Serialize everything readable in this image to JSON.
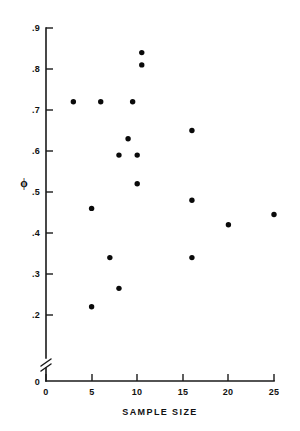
{
  "chart_data": {
    "type": "scatter",
    "title": "",
    "xlabel": "SAMPLE SIZE",
    "ylabel": "ϕ",
    "xlim": [
      0,
      25
    ],
    "ylim": [
      0.15,
      0.9
    ],
    "grid": false,
    "legend": "none",
    "y_axis_break": true,
    "y_axis_break_note": "axis broken between 0 and .2",
    "x_ticks": [
      "0",
      "5",
      "10",
      "15",
      "20",
      "25"
    ],
    "x_tick_values": [
      0,
      5,
      10,
      15,
      20,
      25
    ],
    "y_ticks": [
      "0",
      ".2",
      ".3",
      ".4",
      ".5",
      ".6",
      ".7",
      ".8",
      ".9"
    ],
    "y_tick_values": [
      0,
      0.2,
      0.3,
      0.4,
      0.5,
      0.6,
      0.7,
      0.8,
      0.9
    ],
    "series": [
      {
        "name": "observations",
        "marker": "filled-circle",
        "color": "#0a0a0a",
        "x": [
          10.5,
          10.5,
          3.0,
          6.0,
          9.5,
          9.0,
          8.0,
          10.0,
          10.0,
          16.0,
          25.0,
          20.0,
          5.0,
          7.0,
          16.0,
          8.0,
          5.0
        ],
        "y": [
          0.84,
          0.81,
          0.72,
          0.72,
          0.72,
          0.63,
          0.59,
          0.59,
          0.52,
          0.65,
          0.445,
          0.42,
          0.46,
          0.34,
          0.34,
          0.265,
          0.22
        ]
      }
    ],
    "points": [
      {
        "x": 10.5,
        "y": 0.84
      },
      {
        "x": 10.5,
        "y": 0.81
      },
      {
        "x": 3.0,
        "y": 0.72
      },
      {
        "x": 6.0,
        "y": 0.72
      },
      {
        "x": 9.5,
        "y": 0.72
      },
      {
        "x": 16.0,
        "y": 0.65
      },
      {
        "x": 9.0,
        "y": 0.63
      },
      {
        "x": 8.0,
        "y": 0.59
      },
      {
        "x": 10.0,
        "y": 0.59
      },
      {
        "x": 10.0,
        "y": 0.52
      },
      {
        "x": 16.0,
        "y": 0.48
      },
      {
        "x": 5.0,
        "y": 0.46
      },
      {
        "x": 25.0,
        "y": 0.445
      },
      {
        "x": 20.0,
        "y": 0.42
      },
      {
        "x": 7.0,
        "y": 0.34
      },
      {
        "x": 16.0,
        "y": 0.34
      },
      {
        "x": 8.0,
        "y": 0.265
      },
      {
        "x": 5.0,
        "y": 0.22
      }
    ],
    "point_count": 18
  },
  "axes": {
    "x_title": "SAMPLE SIZE",
    "y_title": "ϕ",
    "x_tick_labels": [
      "0",
      "5",
      "10",
      "15",
      "20",
      "25"
    ],
    "y_tick_labels": [
      ".9",
      ".8",
      ".7",
      ".6",
      ".5",
      ".4",
      ".3",
      ".2",
      "0"
    ],
    "origin_label": "0"
  },
  "colors": {
    "ink": "#111111",
    "marker": "#0a0a0a",
    "background": "#ffffff"
  }
}
